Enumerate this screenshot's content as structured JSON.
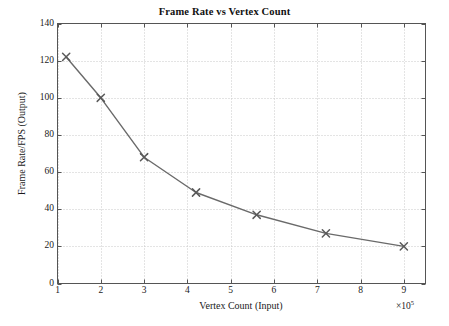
{
  "chart_data": {
    "type": "line",
    "title": "Frame Rate vs Vertex Count",
    "xlabel": "Vertex Count (Input)",
    "ylabel": "Frame Rate/FPS (Output)",
    "x_multiplier": "×10",
    "x_multiplier_exponent": "5",
    "x_unit_scale": 100000,
    "xlim": [
      1,
      9.5
    ],
    "ylim": [
      0,
      140
    ],
    "xticks": [
      1,
      2,
      3,
      4,
      5,
      6,
      7,
      8,
      9
    ],
    "xtick_labels": [
      "1",
      "2",
      "3",
      "4",
      "5",
      "6",
      "7",
      "8",
      "9"
    ],
    "yticks": [
      0,
      20,
      40,
      60,
      80,
      100,
      120,
      140
    ],
    "ytick_labels": [
      "0",
      "20",
      "40",
      "60",
      "80",
      "100",
      "120",
      "140"
    ],
    "grid": true,
    "grid_style": "dotted",
    "grid_color": "#c8c8c8",
    "legend": null,
    "marker": "x",
    "line_color": "#6a6a6a",
    "marker_color": "#5a5a5a",
    "axis_color": "#555555",
    "background": "#ffffff",
    "x": [
      1.2,
      2.0,
      3.0,
      4.2,
      5.6,
      7.2,
      9.0
    ],
    "values": [
      122,
      100,
      68,
      49,
      37,
      27,
      20
    ],
    "series": [
      {
        "name": "Frame Rate",
        "points": [
          {
            "x": 1.2,
            "y": 122
          },
          {
            "x": 2.0,
            "y": 100
          },
          {
            "x": 3.0,
            "y": 68
          },
          {
            "x": 4.2,
            "y": 49
          },
          {
            "x": 5.6,
            "y": 37
          },
          {
            "x": 7.2,
            "y": 27
          },
          {
            "x": 9.0,
            "y": 20
          }
        ]
      }
    ]
  }
}
